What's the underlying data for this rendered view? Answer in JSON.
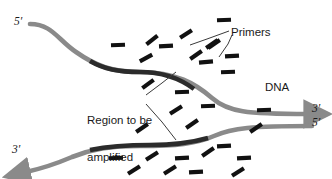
{
  "figure": {
    "background_color": "#ffffff"
  },
  "labels": {
    "primers": "Primers",
    "dna": "DNA",
    "region_line1": "Region to be",
    "region_line2": "amplified"
  },
  "end_markers": {
    "upper_left_5prime": "5′",
    "lower_left_3prime": "3′",
    "upper_right_3prime": "3′",
    "lower_right_5prime": "5′"
  },
  "colors": {
    "strand_grey": "#8a8a8a",
    "strand_dark": "#2b2b2b",
    "primer_black": "#111111",
    "text": "#1a1a1a",
    "leader_line": "#3a3a3a"
  },
  "strands": [
    {
      "name": "upper-strand",
      "grey_path": "M 30 24 C 52 24 58 40 76 52 C 96 66 112 72 140 72 C 176 72 196 84 212 98 C 228 112 244 114 300 114",
      "dark_segment_path": "M 88 60 C 104 69 118 72 140 72 C 164 72 182 80 194 88",
      "arrow_at": "right",
      "arrow_tip": [
        318,
        114
      ]
    },
    {
      "name": "lower-strand",
      "grey_path": "M 300 126 C 250 126 232 128 214 136 C 196 144 176 146 140 146 C 110 146 92 148 72 156 C 58 162 48 166 36 170",
      "dark_segment_path": "M 92 149 C 112 145 124 145 150 145 C 176 145 192 142 206 138",
      "arrow_at": "left",
      "arrow_tip": [
        18,
        172
      ]
    }
  ],
  "leader_lines": {
    "primers": [
      "M 229 31 L 207 39 L 190 45",
      "M 232 35 L 228 44 L 219 57"
    ],
    "region": [
      "M 146 95 L 162 83 L 176 72",
      "M 146 104 L 162 122 L 176 140"
    ]
  },
  "primer_dashes": [
    {
      "x": 118,
      "y": 45,
      "rot": -2
    },
    {
      "x": 152,
      "y": 40,
      "rot": -38
    },
    {
      "x": 146,
      "y": 58,
      "rot": -28
    },
    {
      "x": 166,
      "y": 46,
      "rot": -3
    },
    {
      "x": 186,
      "y": 34,
      "rot": -33
    },
    {
      "x": 196,
      "y": 55,
      "rot": -35
    },
    {
      "x": 206,
      "y": 62,
      "rot": -5
    },
    {
      "x": 214,
      "y": 44,
      "rot": -34
    },
    {
      "x": 224,
      "y": 20,
      "rot": -2
    },
    {
      "x": 232,
      "y": 56,
      "rot": -3
    },
    {
      "x": 228,
      "y": 72,
      "rot": -2
    },
    {
      "x": 148,
      "y": 84,
      "rot": -36
    },
    {
      "x": 182,
      "y": 92,
      "rot": -2
    },
    {
      "x": 176,
      "y": 110,
      "rot": -32
    },
    {
      "x": 208,
      "y": 106,
      "rot": -2
    },
    {
      "x": 192,
      "y": 124,
      "rot": -34
    },
    {
      "x": 142,
      "y": 128,
      "rot": -34
    },
    {
      "x": 212,
      "y": 44,
      "rot": -34
    },
    {
      "x": 116,
      "y": 158,
      "rot": -2
    },
    {
      "x": 152,
      "y": 156,
      "rot": -32
    },
    {
      "x": 182,
      "y": 158,
      "rot": -3
    },
    {
      "x": 208,
      "y": 152,
      "rot": -34
    },
    {
      "x": 224,
      "y": 146,
      "rot": -3
    },
    {
      "x": 134,
      "y": 170,
      "rot": -32
    },
    {
      "x": 170,
      "y": 170,
      "rot": -32
    },
    {
      "x": 196,
      "y": 172,
      "rot": -3
    },
    {
      "x": 244,
      "y": 158,
      "rot": -3
    },
    {
      "x": 238,
      "y": 172,
      "rot": -32
    },
    {
      "x": 256,
      "y": 128,
      "rot": -34
    },
    {
      "x": 264,
      "y": 110,
      "rot": -2
    }
  ]
}
